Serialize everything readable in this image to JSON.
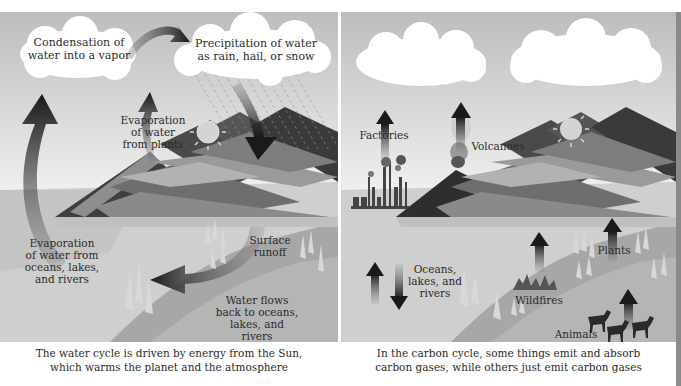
{
  "water_cycle": {
    "labels": {
      "condensation": [
        "Condensation of",
        "water into a vapor"
      ],
      "precipitation": [
        "Precipitation of water",
        "as rain, hail, or snow"
      ],
      "evaporation_plants": [
        "Evaporation",
        "of water",
        "from plants"
      ],
      "evaporation_oceans": [
        "Evaporation",
        "of water from",
        "oceans, lakes,",
        "and rivers"
      ],
      "surface_runoff": [
        "Surface",
        "runoff"
      ],
      "water_flows_back": [
        "Water flows",
        "back to oceans,",
        "lakes, and",
        "rivers"
      ]
    },
    "caption": [
      "The water cycle is driven by energy from the Sun,",
      "which warms the planet and the atmosphere"
    ]
  },
  "carbon_cycle": {
    "labels": {
      "factories": "Factories",
      "volcanoes": "Volcanoes",
      "plants": "Plants",
      "oceans": [
        "Oceans,",
        "lakes, and",
        "rivers"
      ],
      "wildfires": "Wildfires",
      "animals": "Animals"
    },
    "caption": [
      "In the carbon cycle, some things emit and absorb",
      "carbon gases, while others just emit carbon gases"
    ]
  },
  "colors": {
    "sky_top": "#bdbdbd",
    "sky_bottom": "#f2f2f2",
    "mountain_dark": "#3c3c3c",
    "mountain_mid": "#7a7a7a",
    "mountain_light": "#b0b0b0",
    "ground": "#a8a8a8",
    "water": "#c8c8c8",
    "arrow_dark": "#1e1e1e",
    "cloud": "#ffffff",
    "sun": "#d6d6d6"
  }
}
